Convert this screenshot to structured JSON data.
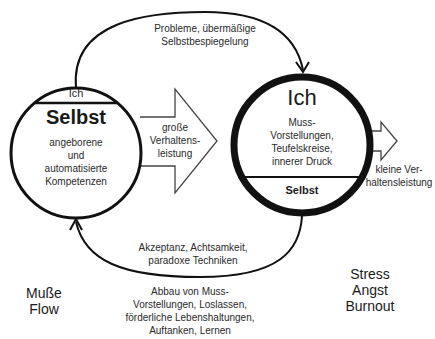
{
  "diagram": {
    "colors": {
      "stroke": "#111111",
      "background": "#ffffff",
      "text": "#2a2a2a"
    },
    "left_circle": {
      "top_segment_label": "Ich",
      "main_label": "Selbst",
      "description": "angeborene\nund\nautomatisierte\nKompetenzen"
    },
    "right_circle": {
      "main_label": "Ich",
      "description": "Muss-\nVorstellungen,\nTeufelskreise,\ninnerer Druck",
      "bottom_segment_label": "Selbst"
    },
    "big_arrow_label": "große\nVerhaltens-\nleistung",
    "small_arrow_label": "kleine Ver-\nhaltensleistung",
    "top_curve_label": "Probleme, übermäßige\nSelbstbespiegelung",
    "bottom_curve_label": "Akzeptanz, Achtsamkeit,\nparadoxe Techniken",
    "bottom_notes": "Abbau von Muss-\nVorstellungen, Loslassen,\nförderliche Lebenshaltungen,\nAuftanken, Lernen",
    "left_state": "Muße\nFlow",
    "right_state": "Stress\nAngst\nBurnout"
  }
}
